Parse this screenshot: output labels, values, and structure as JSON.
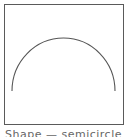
{
  "diagram": {
    "shape": "semicircle",
    "stroke_color": "#555555",
    "frame_color": "#5a5a5a",
    "background": "#ffffff"
  },
  "caption": {
    "text": "Shape — semicircle"
  }
}
